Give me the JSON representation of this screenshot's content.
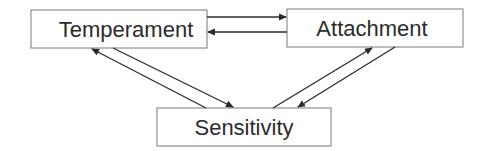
{
  "diagram": {
    "type": "flow",
    "colors": {
      "stroke": "#3a3a3a",
      "box_stroke": "#7a7a7a",
      "text": "#2b2b2b",
      "background": "#ffffff"
    },
    "nodes": [
      {
        "id": "temperament",
        "label": "Temperament"
      },
      {
        "id": "attachment",
        "label": "Attachment"
      },
      {
        "id": "sensitivity",
        "label": "Sensitivity"
      }
    ],
    "edges": [
      {
        "from": "temperament",
        "to": "attachment"
      },
      {
        "from": "attachment",
        "to": "temperament"
      },
      {
        "from": "sensitivity",
        "to": "temperament"
      },
      {
        "from": "temperament",
        "to": "sensitivity"
      },
      {
        "from": "sensitivity",
        "to": "attachment"
      },
      {
        "from": "attachment",
        "to": "sensitivity"
      }
    ]
  }
}
